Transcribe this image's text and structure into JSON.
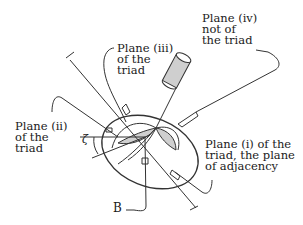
{
  "diagram": {
    "labels": {
      "plane_iii": "Plane (iii)\nof the\ntriad",
      "plane_iv": "Plane (iv)\nnot of\nthe triad",
      "plane_ii": "Plane (ii)\nof the\ntriad",
      "plane_i": "Plane (i) of the\ntriad, the plane\nof adjacency",
      "b": "B",
      "zeta": "ζ"
    },
    "colors": {
      "stroke": "#333333",
      "shade": "#cfcfcf",
      "background": "#ffffff"
    }
  }
}
